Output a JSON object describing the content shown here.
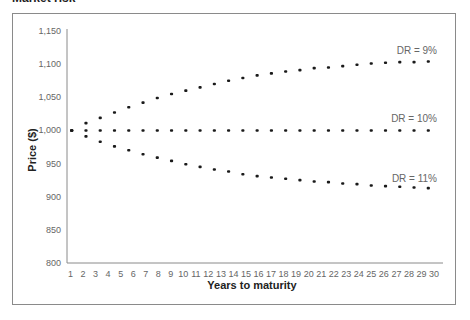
{
  "page": {
    "title": "Market risk"
  },
  "chart_data": {
    "type": "scatter",
    "title": "",
    "xlabel": "Years to maturity",
    "ylabel": "Price ($)",
    "x_tick_labels": [
      "1",
      "2",
      "3",
      "4",
      "5",
      "6",
      "7",
      "8",
      "9",
      "10",
      "11",
      "12",
      "13",
      "14",
      "15",
      "16",
      "17",
      "18",
      "19",
      "20",
      "21",
      "22",
      "23",
      "24",
      "25",
      "26",
      "27",
      "28",
      "29",
      "30"
    ],
    "y_tick_labels": [
      "800",
      "850",
      "900",
      "950",
      "1,000",
      "1,050",
      "1,100",
      "1,150"
    ],
    "y_ticks": [
      800,
      850,
      900,
      950,
      1000,
      1050,
      1100,
      1150
    ],
    "ylim": [
      800,
      1150
    ],
    "xlim": [
      1,
      30
    ],
    "grid": false,
    "legend_position": "inline-labels-right",
    "marker": "dot",
    "points_per_series": 26,
    "series": [
      {
        "name": "DR = 9%",
        "label_y_value": 1115,
        "values": [
          1000,
          1011,
          1019,
          1027,
          1035,
          1042,
          1049,
          1055,
          1060,
          1065,
          1070,
          1075,
          1079,
          1083,
          1086,
          1089,
          1091,
          1094,
          1095,
          1097,
          1099,
          1101,
          1102,
          1103,
          1103,
          1104
        ]
      },
      {
        "name": "DR = 10%",
        "label_y_value": 1013,
        "values": [
          1000,
          1000,
          1000,
          1000,
          1000,
          1000,
          1000,
          1000,
          1000,
          1000,
          1000,
          1000,
          1000,
          1000,
          1000,
          1000,
          1000,
          1000,
          1000,
          1000,
          1000,
          1000,
          1000,
          1000,
          1000,
          1000
        ]
      },
      {
        "name": "DR = 11%",
        "label_y_value": 922,
        "values": [
          1000,
          991,
          983,
          976,
          970,
          964,
          959,
          954,
          949,
          945,
          941,
          938,
          934,
          931,
          929,
          927,
          925,
          923,
          922,
          920,
          919,
          917,
          916,
          915,
          914,
          913
        ]
      }
    ]
  },
  "colors": {
    "dots": "#1a1a1a",
    "axis": "#8a8a8a",
    "tick_text": "#666666",
    "frame": "#8a8a8a"
  }
}
